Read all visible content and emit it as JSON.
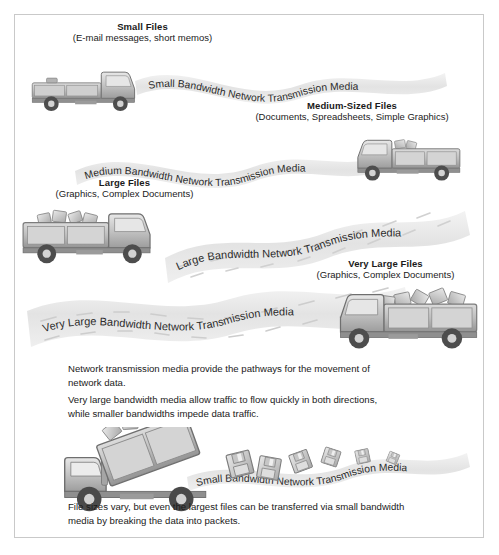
{
  "diagram": {
    "border_color": "#c9c9c9",
    "background": "#ffffff",
    "ribbon_color": "#e4e4e4",
    "truck_body_color": "#9a9a9a",
    "text_color": "#1a1a1a"
  },
  "captions": [
    {
      "id": "small",
      "title": "Small Files",
      "subtitle": "(E-mail messages, short memos)"
    },
    {
      "id": "medium",
      "title": "Medium-Sized Files",
      "subtitle": "(Documents, Spreadsheets, Simple Graphics)"
    },
    {
      "id": "large",
      "title": "Large Files",
      "subtitle": "(Graphics, Complex Documents)"
    },
    {
      "id": "very-large",
      "title": "Very Large Files",
      "subtitle": "(Graphics, Complex Documents)"
    }
  ],
  "ribbons": [
    {
      "id": "small",
      "label": "Small Bandwidth Network Transmission Media"
    },
    {
      "id": "medium",
      "label": "Medium Bandwidth Network Transmission Media"
    },
    {
      "id": "large",
      "label": "Large Bandwidth Network Transmission Media"
    },
    {
      "id": "very-large",
      "label": "Very Large Bandwidth Network Transmission Media"
    },
    {
      "id": "bottom",
      "label": "Small Bandwidth Network Transmission Media"
    }
  ],
  "notes": {
    "note1_line1": "Network transmission media provide the pathways for the movement of",
    "note1_line2": "network data.",
    "note2_line1": "Very large bandwidth media allow traffic to flow quickly in both directions,",
    "note2_line2": "while smaller bandwidths impede data traffic.",
    "note3_line1": "File sizes vary, but even the largest files can be transferred via small bandwidth",
    "note3_line2": "media by breaking the data into packets."
  },
  "icons": {
    "truck_small": "truck-empty-flatbed-icon",
    "truck_medium": "truck-light-load-icon",
    "truck_large": "truck-loaded-icon",
    "truck_very_large": "truck-heavy-load-icon",
    "truck_dump": "dump-truck-unloading-icon",
    "floppy": "floppy-disk-icon"
  }
}
